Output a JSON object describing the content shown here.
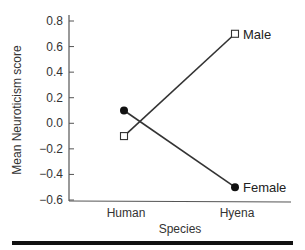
{
  "chart_data": {
    "type": "line",
    "title": "",
    "xlabel": "Species",
    "ylabel": "Mean Neuroticism score",
    "categories": [
      "Human",
      "Hyena"
    ],
    "ylim": [
      -0.6,
      0.8
    ],
    "yticks": [
      0.8,
      0.6,
      0.4,
      0.2,
      0.0,
      -0.2,
      -0.4,
      -0.6
    ],
    "ytick_labels": [
      "0.8",
      "0.6",
      "0.4",
      "0.2",
      "0.0",
      "−0.2",
      "−0.4",
      "−0.6"
    ],
    "grid": false,
    "legend_position": "inline labels at right end of lines",
    "series": [
      {
        "name": "Male",
        "marker": "open-square",
        "values": [
          -0.1,
          0.7
        ]
      },
      {
        "name": "Female",
        "marker": "filled-circle",
        "values": [
          0.1,
          -0.5
        ]
      }
    ]
  },
  "colors": {
    "line": "#333333",
    "text": "#333333",
    "rule": "#111111"
  }
}
